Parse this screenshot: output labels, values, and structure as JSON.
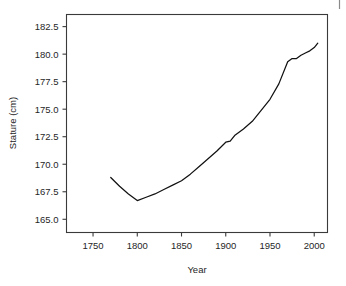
{
  "figure": {
    "background_color": "#ffffff",
    "line_color": "#111111",
    "axis_color": "#3a3a3a",
    "corner_mark_color": "#8a8a8a"
  },
  "chart_data": {
    "type": "line",
    "title": "",
    "subtitle": "",
    "xlabel": "Year",
    "ylabel": "Stature (cm)",
    "xlim": [
      1720,
      2015
    ],
    "ylim": [
      163.8,
      183.6
    ],
    "xticks": [
      1750,
      1800,
      1850,
      1900,
      1950,
      2000
    ],
    "xticklabels": [
      "1750",
      "1800",
      "1850",
      "1900",
      "1950",
      "2000"
    ],
    "yticks": [
      165.0,
      167.5,
      170.0,
      172.5,
      175.0,
      177.5,
      180.0,
      182.5
    ],
    "yticklabels": [
      "165.0",
      "167.5",
      "170.0",
      "172.5",
      "175.0",
      "177.5",
      "180.0",
      "182.5"
    ],
    "grid": false,
    "legend": null,
    "legend_position": "none",
    "series": [
      {
        "name": "Stature",
        "x": [
          1770,
          1780,
          1790,
          1800,
          1810,
          1820,
          1830,
          1840,
          1850,
          1860,
          1870,
          1880,
          1890,
          1900,
          1905,
          1910,
          1920,
          1930,
          1940,
          1950,
          1960,
          1970,
          1975,
          1980,
          1985,
          1990,
          1995,
          2000,
          2004
        ],
        "y": [
          168.8,
          168.0,
          167.3,
          166.7,
          167.0,
          167.3,
          167.7,
          168.1,
          168.5,
          169.1,
          169.8,
          170.5,
          171.2,
          172.0,
          172.1,
          172.6,
          173.2,
          173.9,
          174.9,
          175.9,
          177.3,
          179.3,
          179.6,
          179.6,
          179.9,
          180.1,
          180.3,
          180.6,
          181.0
        ]
      }
    ]
  }
}
